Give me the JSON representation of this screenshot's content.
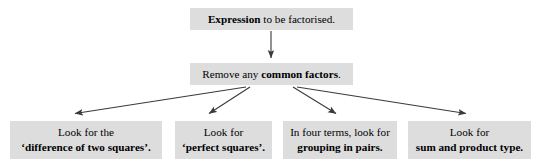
{
  "diagram": {
    "box_fill": "#dddddd",
    "text_color": "#000000",
    "arrow_color": "#3a3a3a",
    "background": "#ffffff"
  },
  "nodes": {
    "expression": {
      "emphasis": "Expression",
      "rest": " to be factorised."
    },
    "common_factors": {
      "lead": "Remove any ",
      "emphasis": "common factors",
      "tail": "."
    },
    "difference_of_two_squares": {
      "line1": "Look for the",
      "line2": "‘difference of two squares’."
    },
    "perfect_squares": {
      "line1": "Look for",
      "line2": "‘perfect squares’."
    },
    "grouping_in_pairs": {
      "line1": "In four terms, look for",
      "line2": "grouping in pairs."
    },
    "sum_and_product": {
      "line1": "Look for",
      "line2": "sum and product type."
    }
  },
  "arrows": [
    {
      "name": "expression-to-common-factors",
      "from": [
        271,
        31
      ],
      "to": [
        271,
        58
      ]
    },
    {
      "name": "common-factors-to-difference-of-two-squares",
      "from": [
        246,
        87
      ],
      "to": [
        74,
        114
      ]
    },
    {
      "name": "common-factors-to-perfect-squares",
      "from": [
        250,
        87
      ],
      "to": [
        208,
        114
      ]
    },
    {
      "name": "common-factors-to-grouping-in-pairs",
      "from": [
        293,
        87
      ],
      "to": [
        337,
        114
      ]
    },
    {
      "name": "common-factors-to-sum-and-product",
      "from": [
        297,
        87
      ],
      "to": [
        467,
        114
      ]
    }
  ]
}
